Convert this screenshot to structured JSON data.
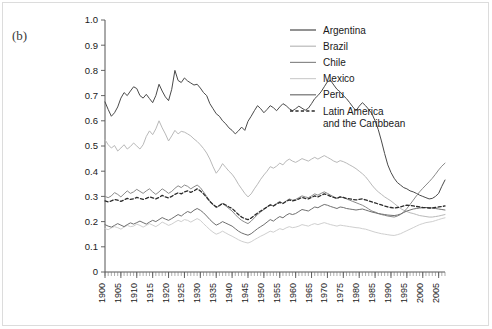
{
  "figure": {
    "panel_label": "(b)",
    "background": "#ffffff",
    "border_color": "#dcdcdc"
  },
  "legend": {
    "position": "top-right",
    "entries": [
      {
        "label": "Argentina",
        "color": "#4a4a4a",
        "style": "solid"
      },
      {
        "label": "Brazil",
        "color": "#b9b9b9",
        "style": "solid"
      },
      {
        "label": "Chile",
        "color": "#8a8a8a",
        "style": "solid"
      },
      {
        "label": "Mexico",
        "color": "#cfcfcf",
        "style": "solid"
      },
      {
        "label": "Peru",
        "color": "#6f6f6f",
        "style": "solid"
      },
      {
        "label": "Latin America",
        "label2": "and the Caribbean",
        "color": "#2b2b2b",
        "style": "dashed"
      }
    ]
  },
  "chart_data": {
    "type": "line",
    "title": "",
    "xlabel": "",
    "ylabel": "",
    "xlim": [
      1900,
      2007
    ],
    "ylim": [
      0,
      1.0
    ],
    "grid": false,
    "legend_position": "top-right",
    "ytick_labels": [
      "0",
      "0.1",
      "0.2",
      "0.3",
      "0.4",
      "0.5",
      "0.6",
      "0.7",
      "0.8",
      "0.9",
      "1.0"
    ],
    "ytick_values": [
      0,
      0.1,
      0.2,
      0.3,
      0.4,
      0.5,
      0.6,
      0.7,
      0.8,
      0.9,
      1.0
    ],
    "xtick_labels": [
      "1900",
      "1905",
      "1910",
      "1915",
      "1920",
      "1925",
      "1930",
      "1935",
      "1940",
      "1945",
      "1950",
      "1955",
      "1960",
      "1965",
      "1970",
      "1975",
      "1980",
      "1985",
      "1990",
      "1995",
      "2000",
      "2005"
    ],
    "xtick_values": [
      1900,
      1905,
      1910,
      1915,
      1920,
      1925,
      1930,
      1935,
      1940,
      1945,
      1950,
      1955,
      1960,
      1965,
      1970,
      1975,
      1980,
      1985,
      1990,
      1995,
      2000,
      2005
    ],
    "x": [
      1900,
      1901,
      1902,
      1903,
      1904,
      1905,
      1906,
      1907,
      1908,
      1909,
      1910,
      1911,
      1912,
      1913,
      1914,
      1915,
      1916,
      1917,
      1918,
      1919,
      1920,
      1921,
      1922,
      1923,
      1924,
      1925,
      1926,
      1927,
      1928,
      1929,
      1930,
      1931,
      1932,
      1933,
      1934,
      1935,
      1936,
      1937,
      1938,
      1939,
      1940,
      1941,
      1942,
      1943,
      1944,
      1945,
      1946,
      1947,
      1948,
      1949,
      1950,
      1951,
      1952,
      1953,
      1954,
      1955,
      1956,
      1957,
      1958,
      1959,
      1960,
      1961,
      1962,
      1963,
      1964,
      1965,
      1966,
      1967,
      1968,
      1969,
      1970,
      1971,
      1972,
      1973,
      1974,
      1975,
      1976,
      1977,
      1978,
      1979,
      1980,
      1981,
      1982,
      1983,
      1984,
      1985,
      1986,
      1987,
      1988,
      1989,
      1990,
      1991,
      1992,
      1993,
      1994,
      1995,
      1996,
      1997,
      1998,
      1999,
      2000,
      2001,
      2002,
      2003,
      2004,
      2005,
      2006,
      2007
    ],
    "series": [
      {
        "name": "Argentina",
        "color": "#4a4a4a",
        "style": "solid",
        "values": [
          0.675,
          0.645,
          0.618,
          0.632,
          0.655,
          0.69,
          0.712,
          0.7,
          0.718,
          0.735,
          0.728,
          0.7,
          0.69,
          0.705,
          0.688,
          0.672,
          0.7,
          0.745,
          0.718,
          0.695,
          0.68,
          0.725,
          0.8,
          0.76,
          0.752,
          0.77,
          0.758,
          0.75,
          0.742,
          0.745,
          0.73,
          0.712,
          0.7,
          0.668,
          0.648,
          0.628,
          0.618,
          0.6,
          0.588,
          0.572,
          0.562,
          0.548,
          0.56,
          0.575,
          0.562,
          0.598,
          0.618,
          0.64,
          0.66,
          0.648,
          0.632,
          0.645,
          0.66,
          0.652,
          0.64,
          0.655,
          0.668,
          0.66,
          0.648,
          0.64,
          0.648,
          0.658,
          0.65,
          0.642,
          0.65,
          0.668,
          0.688,
          0.7,
          0.715,
          0.735,
          0.755,
          0.76,
          0.742,
          0.725,
          0.715,
          0.7,
          0.688,
          0.672,
          0.655,
          0.64,
          0.658,
          0.672,
          0.66,
          0.645,
          0.628,
          0.6,
          0.565,
          0.52,
          0.47,
          0.425,
          0.395,
          0.372,
          0.355,
          0.345,
          0.335,
          0.33,
          0.322,
          0.318,
          0.312,
          0.305,
          0.3,
          0.295,
          0.29,
          0.292,
          0.3,
          0.312,
          0.34,
          0.365
        ]
      },
      {
        "name": "Brazil",
        "color": "#b9b9b9",
        "style": "solid",
        "values": [
          0.525,
          0.505,
          0.492,
          0.502,
          0.48,
          0.492,
          0.505,
          0.488,
          0.498,
          0.512,
          0.5,
          0.488,
          0.505,
          0.538,
          0.56,
          0.545,
          0.568,
          0.6,
          0.572,
          0.548,
          0.52,
          0.54,
          0.562,
          0.548,
          0.558,
          0.555,
          0.548,
          0.54,
          0.528,
          0.518,
          0.505,
          0.49,
          0.472,
          0.448,
          0.418,
          0.392,
          0.408,
          0.43,
          0.415,
          0.4,
          0.388,
          0.37,
          0.348,
          0.33,
          0.312,
          0.298,
          0.31,
          0.33,
          0.348,
          0.368,
          0.385,
          0.4,
          0.418,
          0.412,
          0.42,
          0.432,
          0.425,
          0.44,
          0.448,
          0.44,
          0.435,
          0.442,
          0.45,
          0.445,
          0.44,
          0.448,
          0.455,
          0.448,
          0.455,
          0.462,
          0.455,
          0.448,
          0.44,
          0.435,
          0.442,
          0.438,
          0.432,
          0.425,
          0.418,
          0.41,
          0.4,
          0.39,
          0.378,
          0.362,
          0.345,
          0.33,
          0.318,
          0.308,
          0.298,
          0.29,
          0.282,
          0.272,
          0.262,
          0.252,
          0.245,
          0.24,
          0.235,
          0.232,
          0.228,
          0.224,
          0.222,
          0.22,
          0.218,
          0.218,
          0.22,
          0.222,
          0.225,
          0.228
        ]
      },
      {
        "name": "Chile",
        "color": "#8a8a8a",
        "style": "solid",
        "values": [
          0.3,
          0.295,
          0.302,
          0.315,
          0.308,
          0.298,
          0.31,
          0.322,
          0.312,
          0.318,
          0.328,
          0.32,
          0.312,
          0.322,
          0.33,
          0.318,
          0.308,
          0.318,
          0.33,
          0.322,
          0.312,
          0.32,
          0.332,
          0.342,
          0.335,
          0.345,
          0.34,
          0.33,
          0.338,
          0.345,
          0.335,
          0.318,
          0.3,
          0.282,
          0.268,
          0.255,
          0.262,
          0.272,
          0.262,
          0.252,
          0.242,
          0.228,
          0.215,
          0.205,
          0.198,
          0.192,
          0.202,
          0.215,
          0.228,
          0.238,
          0.248,
          0.258,
          0.268,
          0.262,
          0.272,
          0.28,
          0.272,
          0.282,
          0.29,
          0.285,
          0.288,
          0.295,
          0.302,
          0.298,
          0.295,
          0.302,
          0.31,
          0.305,
          0.312,
          0.318,
          0.312,
          0.305,
          0.298,
          0.292,
          0.298,
          0.295,
          0.29,
          0.285,
          0.28,
          0.275,
          0.27,
          0.265,
          0.258,
          0.25,
          0.242,
          0.238,
          0.232,
          0.228,
          0.225,
          0.222,
          0.22,
          0.218,
          0.222,
          0.228,
          0.238,
          0.252,
          0.268,
          0.285,
          0.302,
          0.318,
          0.332,
          0.345,
          0.358,
          0.372,
          0.388,
          0.405,
          0.42,
          0.432
        ]
      },
      {
        "name": "Mexico",
        "color": "#cfcfcf",
        "style": "solid",
        "values": [
          0.172,
          0.168,
          0.175,
          0.18,
          0.176,
          0.17,
          0.178,
          0.185,
          0.18,
          0.182,
          0.19,
          0.185,
          0.178,
          0.185,
          0.192,
          0.186,
          0.18,
          0.188,
          0.198,
          0.192,
          0.185,
          0.19,
          0.198,
          0.205,
          0.2,
          0.208,
          0.205,
          0.198,
          0.205,
          0.212,
          0.205,
          0.192,
          0.18,
          0.168,
          0.158,
          0.15,
          0.155,
          0.162,
          0.155,
          0.148,
          0.142,
          0.135,
          0.128,
          0.122,
          0.118,
          0.115,
          0.12,
          0.128,
          0.135,
          0.142,
          0.148,
          0.155,
          0.162,
          0.158,
          0.165,
          0.172,
          0.168,
          0.175,
          0.18,
          0.176,
          0.178,
          0.182,
          0.188,
          0.185,
          0.182,
          0.188,
          0.192,
          0.188,
          0.192,
          0.196,
          0.192,
          0.188,
          0.185,
          0.182,
          0.186,
          0.184,
          0.182,
          0.18,
          0.178,
          0.176,
          0.175,
          0.172,
          0.17,
          0.166,
          0.162,
          0.158,
          0.155,
          0.152,
          0.15,
          0.148,
          0.146,
          0.145,
          0.148,
          0.152,
          0.158,
          0.164,
          0.17,
          0.176,
          0.182,
          0.188,
          0.192,
          0.196,
          0.198,
          0.2,
          0.204,
          0.208,
          0.212,
          0.215
        ]
      },
      {
        "name": "Peru",
        "color": "#6f6f6f",
        "style": "solid",
        "values": [
          0.188,
          0.182,
          0.178,
          0.185,
          0.192,
          0.186,
          0.18,
          0.188,
          0.195,
          0.19,
          0.196,
          0.202,
          0.196,
          0.19,
          0.198,
          0.205,
          0.2,
          0.208,
          0.216,
          0.21,
          0.205,
          0.212,
          0.22,
          0.228,
          0.222,
          0.232,
          0.24,
          0.235,
          0.245,
          0.252,
          0.245,
          0.235,
          0.222,
          0.208,
          0.196,
          0.186,
          0.192,
          0.2,
          0.194,
          0.188,
          0.182,
          0.172,
          0.162,
          0.155,
          0.15,
          0.146,
          0.152,
          0.162,
          0.172,
          0.18,
          0.188,
          0.198,
          0.208,
          0.202,
          0.212,
          0.22,
          0.215,
          0.225,
          0.232,
          0.228,
          0.232,
          0.24,
          0.248,
          0.245,
          0.242,
          0.25,
          0.258,
          0.255,
          0.262,
          0.268,
          0.265,
          0.26,
          0.256,
          0.252,
          0.258,
          0.256,
          0.252,
          0.25,
          0.248,
          0.246,
          0.248,
          0.25,
          0.246,
          0.242,
          0.238,
          0.235,
          0.232,
          0.23,
          0.228,
          0.226,
          0.225,
          0.224,
          0.226,
          0.23,
          0.236,
          0.242,
          0.246,
          0.25,
          0.252,
          0.254,
          0.255,
          0.256,
          0.255,
          0.254,
          0.252,
          0.25,
          0.248,
          0.246
        ]
      },
      {
        "name": "Latin America and the Caribbean",
        "color": "#2b2b2b",
        "style": "dashed",
        "values": [
          0.282,
          0.278,
          0.282,
          0.288,
          0.285,
          0.28,
          0.286,
          0.292,
          0.288,
          0.29,
          0.296,
          0.292,
          0.288,
          0.292,
          0.298,
          0.294,
          0.29,
          0.296,
          0.304,
          0.298,
          0.294,
          0.3,
          0.308,
          0.314,
          0.31,
          0.318,
          0.322,
          0.316,
          0.322,
          0.33,
          0.322,
          0.31,
          0.296,
          0.28,
          0.268,
          0.258,
          0.264,
          0.272,
          0.266,
          0.258,
          0.252,
          0.24,
          0.228,
          0.218,
          0.212,
          0.208,
          0.214,
          0.224,
          0.234,
          0.242,
          0.25,
          0.258,
          0.266,
          0.262,
          0.27,
          0.276,
          0.272,
          0.28,
          0.286,
          0.282,
          0.285,
          0.29,
          0.296,
          0.292,
          0.29,
          0.296,
          0.302,
          0.298,
          0.304,
          0.31,
          0.306,
          0.3,
          0.296,
          0.292,
          0.298,
          0.296,
          0.292,
          0.29,
          0.288,
          0.286,
          0.288,
          0.29,
          0.286,
          0.282,
          0.278,
          0.274,
          0.27,
          0.266,
          0.262,
          0.258,
          0.256,
          0.254,
          0.256,
          0.258,
          0.262,
          0.265,
          0.264,
          0.262,
          0.26,
          0.258,
          0.256,
          0.255,
          0.254,
          0.254,
          0.256,
          0.258,
          0.26,
          0.262
        ]
      }
    ]
  }
}
